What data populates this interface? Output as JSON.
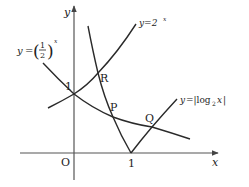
{
  "diagram": {
    "type": "function-graph",
    "axes": {
      "x_label": "x",
      "y_label": "y",
      "origin_label": "O",
      "x_tick_label": "1",
      "y_tick_label": "1"
    },
    "curves": [
      {
        "id": "exp2",
        "label_prefix": "y=2",
        "label_sup": "x",
        "description": "y = 2^x"
      },
      {
        "id": "exphalf",
        "label_prefix": "y=",
        "label_frac_num": "1",
        "label_frac_den": "2",
        "label_sup": "x",
        "description": "y = (1/2)^x"
      },
      {
        "id": "abslog",
        "label_prefix": "y=|log",
        "label_sub": "2",
        "label_suffix": "x|",
        "description": "y = |log2 x|"
      }
    ],
    "points": [
      {
        "name": "R",
        "label": "R"
      },
      {
        "name": "P",
        "label": "P"
      },
      {
        "name": "Q",
        "label": "Q"
      }
    ],
    "colors": {
      "stroke": "#2a2a2a",
      "axis": "#555555",
      "background": "#ffffff"
    }
  }
}
